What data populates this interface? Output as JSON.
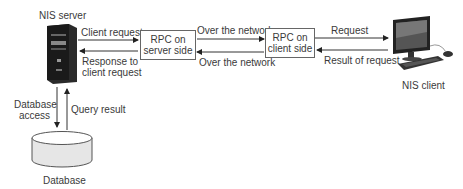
{
  "nodes": {
    "server": {
      "label": "NIS server"
    },
    "rpc_server": {
      "line1": "RPC on",
      "line2": "server side"
    },
    "rpc_client": {
      "line1": "RPC on",
      "line2": "client side"
    },
    "client": {
      "label": "NIS client"
    },
    "database": {
      "label": "Database"
    }
  },
  "edges": {
    "client_request": "Client request",
    "response_line1": "Response to",
    "response_line2": "client request",
    "over_network_top": "Over the network",
    "over_network_bottom": "Over the network",
    "request": "Request",
    "result_of_request": "Result of request",
    "db_access_line1": "Database",
    "db_access_line2": "access",
    "query_result": "Query result"
  },
  "colors": {
    "line": "#333333",
    "box_border": "#666666",
    "db_fill": "#e6e6e6"
  }
}
